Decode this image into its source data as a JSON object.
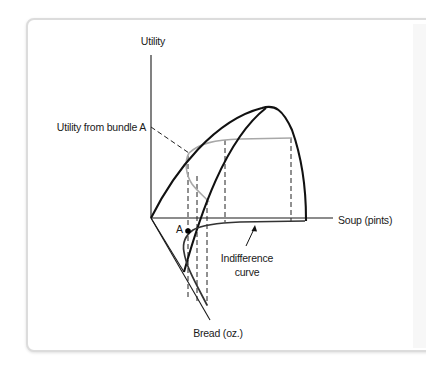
{
  "figure": {
    "axes": {
      "utility_label": "Utility",
      "soup_label": "Soup (pints)",
      "bread_label": "Bread (oz.)"
    },
    "annotations": {
      "utility_from_bundle": "Utility from bundle A",
      "point_label": "A",
      "indifference_line1": "Indifference",
      "indifference_line2": "curve"
    },
    "colors": {
      "axis": "#1a1a1a",
      "surface_edge": "#111111",
      "utility_contour": "#a8a8a8",
      "indifference_curve": "#333333",
      "dashed": "#222222",
      "card_border": "#dcdcdc"
    }
  }
}
